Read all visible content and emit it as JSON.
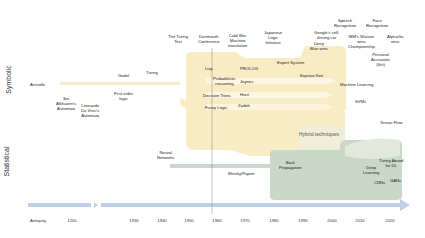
{
  "sections": {
    "symbolic": "Symbolic",
    "statistical": "Statistical",
    "hybrid": "Hybrid techniques"
  },
  "axis": {
    "ticks": [
      {
        "label": "Antiquity",
        "x": 38
      },
      {
        "label": "1200",
        "x": 72
      },
      {
        "label": "1930",
        "x": 134
      },
      {
        "label": "1940",
        "x": 162
      },
      {
        "label": "1950",
        "x": 189
      },
      {
        "label": "1960",
        "x": 217
      },
      {
        "label": "1970",
        "x": 245
      },
      {
        "label": "1980",
        "x": 274
      },
      {
        "label": "1990",
        "x": 303
      },
      {
        "label": "2000",
        "x": 332
      },
      {
        "label": "2010",
        "x": 360
      },
      {
        "label": "2020",
        "x": 390
      }
    ]
  },
  "events_top": {
    "turing_test": "The Turing\nTest",
    "dartmouth": "Dartmouth\nConference",
    "cold_war": "Cold War\nMachine\ntranslation",
    "japanese": "Japanese\nLogic\nInitiative",
    "speech": "Speech\nRecognition",
    "face": "Face\nRecognition",
    "google_car": "Google's self-\ndriving car",
    "deep_blue": "Deep\nBlue wins",
    "watson": "IBM's Watson\nwins\nChampionship",
    "alphago": "AlphaGo\nwins",
    "assistants": "Personal\nAssistants\n(Siri)"
  },
  "symbolic_items": {
    "aristotle": "Aristotle",
    "ibn": "Ibn\nAlkhazen's\nAutomata",
    "leonardo": "Leonardo\nDa Vinci's\nAutomata",
    "godel": "Godel",
    "first_order": "First order\nlogic",
    "turing": "Turing",
    "lisp": "Lisp",
    "prolog": "PROLOG",
    "expert": "Expert System",
    "prob": "Probabilistic\nreasoning",
    "jaynes": "Jaynes",
    "bayes": "Bayesian Nets",
    "decision": "Decision Trees",
    "hunt": "Hunt",
    "ml": "Machine Learning",
    "fuzzy": "Fuzzy Logic",
    "zadeh": "Zadeh",
    "svms": "SVMs",
    "tensorflow": "Tensor Flow"
  },
  "statistical_items": {
    "neural": "Neural\nNetworks",
    "minsky": "Minsky/Papert",
    "backprop": "Back\nPropagation",
    "deep": "Deep\nLearning",
    "turing_award": "Turing Award\nfor DL",
    "cnns": "CNNs",
    "gans": "GANs"
  },
  "colors": {
    "symbolic_band": "#f8ecc4",
    "statistical_band": "#c9d8c8",
    "hybrid_overlap": "#e4ead8",
    "timeline_arrow": "#bfd0e6",
    "divider": "#888888"
  }
}
